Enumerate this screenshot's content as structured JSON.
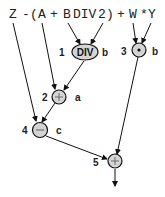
{
  "expression": {
    "tokens": [
      {
        "text": "Z",
        "x": 9
      },
      {
        "text": "-",
        "x": 22
      },
      {
        "text": "(",
        "x": 30
      },
      {
        "text": "A",
        "x": 38
      },
      {
        "text": "+",
        "x": 50
      },
      {
        "text": "B",
        "x": 63
      },
      {
        "text": "DIV",
        "x": 72
      },
      {
        "text": "2",
        "x": 98
      },
      {
        "text": ")",
        "x": 106
      },
      {
        "text": "+",
        "x": 118
      },
      {
        "text": "W",
        "x": 130
      },
      {
        "text": "*",
        "x": 141
      },
      {
        "text": "Y",
        "x": 148
      }
    ]
  },
  "nodes": [
    {
      "id": 1,
      "number": "1",
      "op": "DIV",
      "result": "b"
    },
    {
      "id": 2,
      "number": "2",
      "op": "+",
      "result": "a"
    },
    {
      "id": 3,
      "number": "3",
      "op": "*",
      "result": "b"
    },
    {
      "id": 4,
      "number": "4",
      "op": "−",
      "result": "c"
    },
    {
      "id": 5,
      "number": "5",
      "op": "+",
      "result": ""
    }
  ]
}
